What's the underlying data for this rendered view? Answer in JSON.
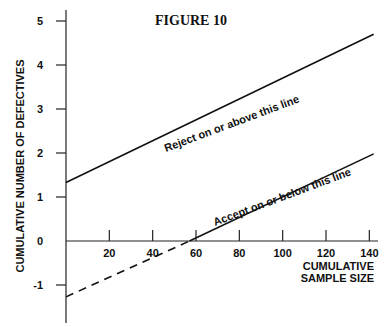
{
  "chart_data": {
    "type": "line",
    "title": "FIGURE 10",
    "xlabel": "CUMULATIVE SAMPLE SIZE",
    "xlabel_lines": [
      "CUMULATIVE",
      "SAMPLE SIZE"
    ],
    "ylabel": "CUMULATIVE NUMBER OF DEFECTIVES",
    "xlim": [
      0,
      142
    ],
    "ylim": [
      -1.8,
      5.2
    ],
    "x_ticks": [
      20,
      40,
      60,
      80,
      100,
      120,
      140
    ],
    "y_ticks": [
      -1,
      0,
      1,
      2,
      3,
      4,
      5
    ],
    "grid": false,
    "series": [
      {
        "name": "Reject on or above this line",
        "style": "solid",
        "x": [
          0,
          142
        ],
        "y": [
          1.33,
          4.7
        ]
      },
      {
        "name": "Accept on or below this line",
        "style": "solid",
        "x": [
          57,
          142
        ],
        "y": [
          0,
          1.98
        ]
      },
      {
        "name": "Accept line extension",
        "style": "dashed",
        "x": [
          0,
          57
        ],
        "y": [
          -1.27,
          0
        ]
      }
    ],
    "annotations": [
      "Reject on or above this line",
      "Accept on or below this line"
    ]
  }
}
